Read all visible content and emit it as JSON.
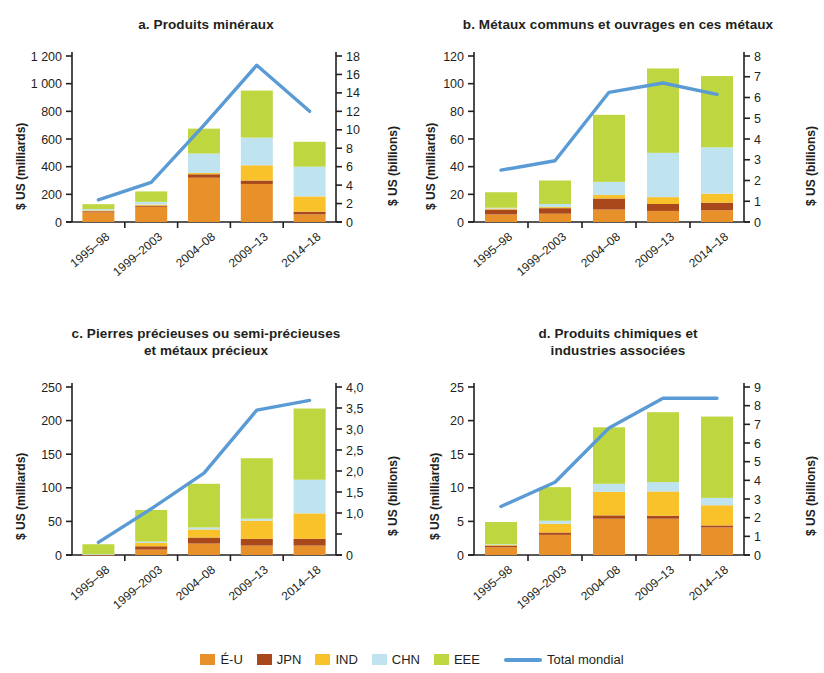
{
  "colors": {
    "us": "#E8912A",
    "jpn": "#A8481B",
    "ind": "#F9C22B",
    "chn": "#BFE3EF",
    "eee": "#BED640",
    "line": "#5B9BD5",
    "axis": "#231f20"
  },
  "legend": {
    "items": [
      {
        "key": "us",
        "label": "É-U"
      },
      {
        "key": "jpn",
        "label": "JPN"
      },
      {
        "key": "ind",
        "label": "IND"
      },
      {
        "key": "chn",
        "label": "CHN"
      },
      {
        "key": "eee",
        "label": "EEE"
      }
    ],
    "line_label": "Total mondial"
  },
  "axis_titles": {
    "left": "$ US (milliards)",
    "right": "$ US (billions)"
  },
  "categories": [
    "1995–98",
    "1999–2003",
    "2004–08",
    "2009–13",
    "2014–18"
  ],
  "chart_data": [
    {
      "id": "a",
      "type": "bar",
      "title": "a. Produits minéraux",
      "xlabel": "",
      "ylabel": "$ US (milliards)",
      "y2label": "$ US (billions)",
      "categories": [
        "1995–98",
        "1999–2003",
        "2004–08",
        "2009–13",
        "2014–18"
      ],
      "ylim": [
        0,
        1200
      ],
      "yticks": [
        0,
        200,
        400,
        600,
        800,
        1000,
        1200
      ],
      "yticklabels": [
        "0",
        "200",
        "400",
        "600",
        "800",
        "1 000",
        "1 200"
      ],
      "y2lim": [
        0,
        18
      ],
      "y2ticks": [
        0,
        2,
        4,
        6,
        8,
        10,
        12,
        14,
        16,
        18
      ],
      "y2ticklabels": [
        "0",
        "2",
        "4",
        "6",
        "8",
        "10",
        "12",
        "14",
        "16",
        "18"
      ],
      "stacked": true,
      "series": [
        {
          "name": "É-U",
          "key": "us",
          "values": [
            70,
            110,
            320,
            275,
            55
          ]
        },
        {
          "name": "JPN",
          "key": "jpn",
          "values": [
            8,
            8,
            25,
            25,
            20
          ]
        },
        {
          "name": "IND",
          "key": "ind",
          "values": [
            6,
            8,
            10,
            110,
            110
          ]
        },
        {
          "name": "CHN",
          "key": "chn",
          "values": [
            10,
            20,
            140,
            200,
            215
          ]
        },
        {
          "name": "EEE",
          "key": "eee",
          "values": [
            35,
            75,
            180,
            340,
            180
          ]
        }
      ],
      "totals": [
        129,
        221,
        675,
        950,
        580
      ],
      "line": {
        "name": "Total mondial",
        "values": [
          2.4,
          4.3,
          10.5,
          17.0,
          12.0
        ],
        "axis": "right"
      },
      "grid": false,
      "legend_position": "bottom"
    },
    {
      "id": "b",
      "type": "bar",
      "title": "b. Métaux communs et ouvrages en ces métaux",
      "xlabel": "",
      "ylabel": "$ US (milliards)",
      "y2label": "$ US (billions)",
      "categories": [
        "1995–98",
        "1999–2003",
        "2004–08",
        "2009–13",
        "2014–18"
      ],
      "ylim": [
        0,
        120
      ],
      "yticks": [
        0,
        20,
        40,
        60,
        80,
        100,
        120
      ],
      "yticklabels": [
        "0",
        "20",
        "40",
        "60",
        "80",
        "100",
        "120"
      ],
      "y2lim": [
        0,
        8
      ],
      "y2ticks": [
        0,
        1,
        2,
        3,
        4,
        5,
        6,
        7,
        8
      ],
      "y2ticklabels": [
        "0",
        "1",
        "2",
        "3",
        "4",
        "5",
        "6",
        "7",
        "8"
      ],
      "stacked": true,
      "series": [
        {
          "name": "É-U",
          "key": "us",
          "values": [
            5.5,
            6.0,
            9.0,
            8.0,
            8.5
          ]
        },
        {
          "name": "JPN",
          "key": "jpn",
          "values": [
            3.5,
            4.0,
            8.0,
            5.0,
            5.5
          ]
        },
        {
          "name": "IND",
          "key": "ind",
          "values": [
            0.7,
            0.8,
            2.5,
            5.0,
            6.5
          ]
        },
        {
          "name": "CHN",
          "key": "chn",
          "values": [
            0.6,
            2.2,
            9.5,
            32.0,
            33.5
          ]
        },
        {
          "name": "EEE",
          "key": "eee",
          "values": [
            11.2,
            17.0,
            48.5,
            61.0,
            51.5
          ]
        }
      ],
      "totals": [
        21.5,
        30.0,
        77.5,
        111.0,
        105.5
      ],
      "line": {
        "name": "Total mondial",
        "values": [
          2.5,
          2.95,
          6.25,
          6.7,
          6.15
        ],
        "axis": "right"
      },
      "grid": false,
      "legend_position": "bottom"
    },
    {
      "id": "c",
      "type": "bar",
      "title": "c. Pierres précieuses ou semi-précieuses\net métaux précieux",
      "title_lines": [
        "c. Pierres précieuses ou semi-précieuses",
        "et métaux précieux"
      ],
      "xlabel": "",
      "ylabel": "$ US (milliards)",
      "y2label": "$ US (billions)",
      "categories": [
        "1995–98",
        "1999–2003",
        "2004–08",
        "2009–13",
        "2014–18"
      ],
      "ylim": [
        0,
        250
      ],
      "yticks": [
        0,
        50,
        100,
        150,
        200,
        250
      ],
      "yticklabels": [
        "0",
        "50",
        "100",
        "150",
        "200",
        "250"
      ],
      "y2lim": [
        0,
        4.0
      ],
      "y2ticks": [
        0,
        0.5,
        1.0,
        1.5,
        2.0,
        2.5,
        3.0,
        3.5,
        4.0
      ],
      "y2ticklabels": [
        "0",
        "",
        "1,0",
        "1,5",
        "2,0",
        "2,5",
        "3,0",
        "3,5",
        "4,0"
      ],
      "stacked": true,
      "series": [
        {
          "name": "É-U",
          "key": "us",
          "values": [
            0.5,
            8,
            17,
            14,
            14
          ]
        },
        {
          "name": "JPN",
          "key": "jpn",
          "values": [
            0.3,
            5,
            9,
            10,
            10
          ]
        },
        {
          "name": "IND",
          "key": "ind",
          "values": [
            0.4,
            5,
            12,
            27,
            38
          ]
        },
        {
          "name": "CHN",
          "key": "chn",
          "values": [
            0.3,
            2,
            3,
            3,
            50
          ]
        },
        {
          "name": "EEE",
          "key": "eee",
          "values": [
            14.5,
            47,
            65,
            90,
            106
          ]
        }
      ],
      "totals": [
        16,
        67,
        106,
        144,
        218
      ],
      "line": {
        "name": "Total mondial",
        "values": [
          0.3,
          1.1,
          1.95,
          3.45,
          3.68
        ],
        "axis": "right"
      },
      "grid": false,
      "legend_position": "bottom"
    },
    {
      "id": "d",
      "type": "bar",
      "title": "d. Produits chimiques et\nindustries associées",
      "title_lines": [
        "d. Produits chimiques et",
        "industries associées"
      ],
      "xlabel": "",
      "ylabel": "$ US (milliards)",
      "y2label": "$ US (billions)",
      "categories": [
        "1995–98",
        "1999–2003",
        "2004–08",
        "2009–13",
        "2014–18"
      ],
      "ylim": [
        0,
        25
      ],
      "yticks": [
        0,
        5,
        10,
        15,
        20,
        25
      ],
      "yticklabels": [
        "0",
        "5",
        "10",
        "15",
        "20",
        "25"
      ],
      "y2lim": [
        0,
        9
      ],
      "y2ticks": [
        0,
        1,
        2,
        3,
        4,
        5,
        6,
        7,
        8,
        9
      ],
      "y2ticklabels": [
        "0",
        "1",
        "2",
        "3",
        "4",
        "5",
        "6",
        "7",
        "8",
        "9"
      ],
      "stacked": true,
      "series": [
        {
          "name": "É-U",
          "key": "us",
          "values": [
            1.15,
            3.0,
            5.4,
            5.4,
            4.1
          ]
        },
        {
          "name": "JPN",
          "key": "jpn",
          "values": [
            0.25,
            0.35,
            0.5,
            0.45,
            0.3
          ]
        },
        {
          "name": "IND",
          "key": "ind",
          "values": [
            0.1,
            1.3,
            3.5,
            3.6,
            3.0
          ]
        },
        {
          "name": "CHN",
          "key": "chn",
          "values": [
            0.1,
            0.45,
            1.2,
            1.4,
            1.1
          ]
        },
        {
          "name": "EEE",
          "key": "eee",
          "values": [
            3.3,
            5.0,
            8.4,
            10.4,
            12.1
          ]
        }
      ],
      "totals": [
        4.9,
        10.1,
        19.0,
        21.25,
        20.6
      ],
      "line": {
        "name": "Total mondial",
        "values": [
          2.6,
          3.9,
          6.8,
          8.4,
          8.4
        ],
        "axis": "right"
      },
      "grid": false,
      "legend_position": "bottom"
    }
  ]
}
